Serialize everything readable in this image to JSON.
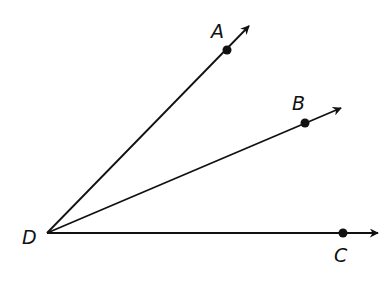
{
  "diagram": {
    "type": "angle-rays",
    "vertex": {
      "label": "D",
      "x": 47,
      "y": 233
    },
    "rays": [
      {
        "name": "ray-DA",
        "point_label": "A",
        "point": [
          227,
          50
        ],
        "end": [
          249,
          26
        ]
      },
      {
        "name": "ray-DB",
        "point_label": "B",
        "point": [
          305,
          123
        ],
        "end": [
          341,
          108
        ]
      },
      {
        "name": "ray-DC",
        "point_label": "C",
        "point": [
          343,
          233
        ],
        "end": [
          378,
          233
        ]
      }
    ],
    "labels": {
      "A": "A",
      "B": "B",
      "C": "C",
      "D": "D"
    },
    "colors": {
      "stroke": "#111111",
      "background": "#ffffff"
    }
  }
}
